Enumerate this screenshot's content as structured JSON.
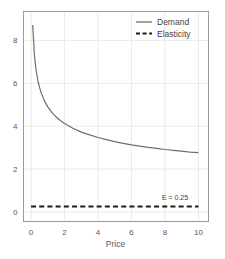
{
  "chart_data": {
    "type": "line",
    "title": "",
    "xlabel": "Price",
    "ylabel": "",
    "xlim": [
      -0.45,
      10.6
    ],
    "ylim": [
      -0.45,
      9.35
    ],
    "grid": true,
    "legend_position": "top-right",
    "xticks": [
      "0",
      "2",
      "4",
      "6",
      "8",
      "10"
    ],
    "xtick_values": [
      0,
      2,
      4,
      6,
      8,
      10
    ],
    "yticks": [
      "0",
      "2",
      "4",
      "6",
      "8"
    ],
    "ytick_values": [
      0,
      2,
      4,
      6,
      8
    ],
    "series": [
      {
        "name": "Demand",
        "style": "solid",
        "color": "#6e6e6e",
        "x": [
          0.1,
          0.2,
          0.3,
          0.4,
          0.5,
          0.6,
          0.8,
          1.0,
          1.25,
          1.5,
          1.75,
          2.0,
          2.5,
          3.0,
          3.5,
          4.0,
          4.5,
          5.0,
          5.5,
          6.0,
          6.5,
          7.0,
          7.5,
          8.0,
          8.5,
          9.0,
          9.5,
          10.0
        ],
        "values": [
          8.72,
          7.33,
          6.62,
          6.16,
          5.83,
          5.57,
          5.18,
          4.9,
          4.63,
          4.43,
          4.26,
          4.12,
          3.9,
          3.72,
          3.59,
          3.47,
          3.37,
          3.28,
          3.2,
          3.13,
          3.07,
          3.01,
          2.96,
          2.91,
          2.87,
          2.83,
          2.79,
          2.76
        ]
      },
      {
        "name": "Elasticity",
        "style": "dashed",
        "color": "#1a1a1a",
        "x": [
          0,
          10
        ],
        "values": [
          0.25,
          0.25
        ]
      }
    ],
    "annotations": [
      {
        "text": "E = 0.25",
        "x": 8.6,
        "y": 0.55
      }
    ]
  },
  "legend": {
    "items": [
      {
        "label": "Demand",
        "style": "solid",
        "color": "#6e6e6e"
      },
      {
        "label": "Elasticity",
        "style": "dashed",
        "color": "#1a1a1a"
      }
    ]
  },
  "axes": {
    "x_title": "Price",
    "y_title": ""
  },
  "colors": {
    "frame": "#9b9b9b",
    "grid": "#ebebeb",
    "demand": "#6e6e6e",
    "elasticity": "#1a1a1a",
    "text": "#58595b",
    "background": "#ffffff"
  }
}
